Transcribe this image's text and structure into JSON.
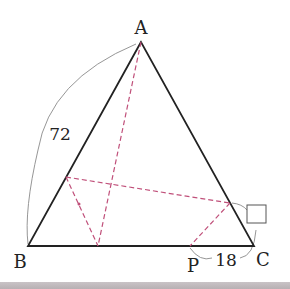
{
  "diagram": {
    "type": "geometry-folding-triangle",
    "vertices": {
      "A": {
        "label": "A",
        "x": 141,
        "y": 42
      },
      "B": {
        "label": "B",
        "x": 28,
        "y": 246
      },
      "C": {
        "label": "C",
        "x": 254,
        "y": 246
      }
    },
    "points": {
      "P": {
        "label": "P",
        "x": 190,
        "y": 246
      },
      "D_on_AB": {
        "x": 66,
        "y": 177
      },
      "E_on_BC": {
        "x": 98,
        "y": 246
      },
      "F_on_AC": {
        "x": 230,
        "y": 203
      }
    },
    "measurements": {
      "AB": "72",
      "PC": "18",
      "unknown": ""
    },
    "colors": {
      "triangle": "#222222",
      "fold_lines": "#c0507a",
      "arcs": "#888888"
    }
  }
}
